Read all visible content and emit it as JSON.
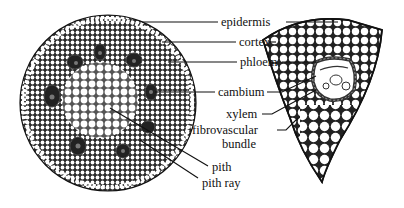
{
  "diagram": {
    "labels": [
      {
        "id": "epidermis",
        "text": "epidermis"
      },
      {
        "id": "cortex",
        "text": "cortex"
      },
      {
        "id": "phloem",
        "text": "phloem"
      },
      {
        "id": "cambium",
        "text": "cambium"
      },
      {
        "id": "xylem",
        "text": "xylem"
      },
      {
        "id": "fibrovascular-1",
        "text": "fibrovascular"
      },
      {
        "id": "fibrovascular-2",
        "text": "bundle"
      },
      {
        "id": "pith",
        "text": "pith"
      },
      {
        "id": "pith-ray",
        "text": "pith ray"
      }
    ]
  }
}
